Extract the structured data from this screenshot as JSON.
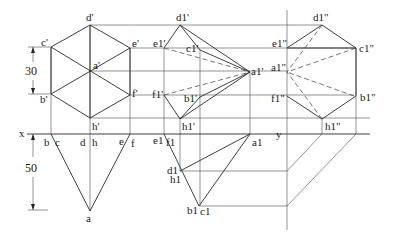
{
  "figure": {
    "type": "orthographic projection drawing of hexagonal pyramid (original and rotated)",
    "axes": {
      "x_label": "x",
      "y_label": "y"
    },
    "dimensions": [
      {
        "id": "dim-30",
        "value": "30"
      },
      {
        "id": "dim-50",
        "value": "50"
      }
    ],
    "labels": {
      "front": {
        "d": "d'",
        "c": "c'",
        "e": "e'",
        "a": "a'",
        "b": "b'",
        "f": "f'",
        "h": "h'"
      },
      "top": {
        "b": "b",
        "c": "c",
        "d": "d",
        "h": "h",
        "e": "e",
        "f": "f",
        "a": "a"
      },
      "front_rotated": {
        "d1": "d1'",
        "e1": "e1'",
        "c1": "c1'",
        "a1": "a1'",
        "f1": "f1'",
        "b1": "b1'",
        "h1": "h1'"
      },
      "top_rotated": {
        "e1": "e1",
        "f1": "f1",
        "a1": "a1",
        "d1": "d1",
        "h1": "h1",
        "b1": "b1",
        "c1": "c1"
      },
      "side_rotated": {
        "d1": "d1\"",
        "e1": "e1\"",
        "c1": "c1\"",
        "a1": "a1\"",
        "f1": "f1\"",
        "b1": "b1\"",
        "h1": "h1\""
      }
    }
  }
}
